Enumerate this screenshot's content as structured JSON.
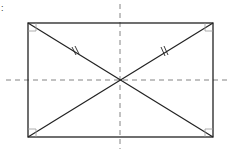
{
  "diagram": {
    "corner_label": ":",
    "rectangle": {
      "x1": 28,
      "y1": 23,
      "x2": 213,
      "y2": 137
    },
    "center": {
      "x": 120,
      "y": 80
    },
    "axes": {
      "vertical": {
        "x": 120,
        "y1": 4,
        "y2": 149
      },
      "horizontal": {
        "y": 80,
        "x1": 6,
        "x2": 227
      }
    },
    "right_angle_size": 8,
    "equal_marks": "double tick on upper half of each diagonal",
    "colors": {
      "stroke": "#222222",
      "dashed": "#777777",
      "background": "#ffffff"
    }
  }
}
